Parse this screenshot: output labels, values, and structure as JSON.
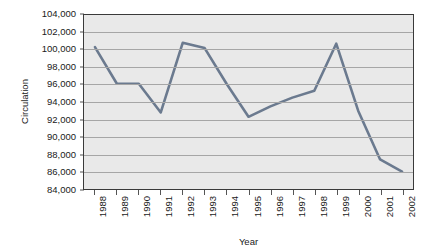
{
  "chart_data": {
    "type": "line",
    "title": "",
    "xlabel": "Year",
    "ylabel": "Circulation",
    "categories": [
      "1988",
      "1989",
      "1990",
      "1991",
      "1992",
      "1993",
      "1994",
      "1995",
      "1996",
      "1997",
      "1998",
      "1999",
      "2000",
      "2001",
      "2002"
    ],
    "values": [
      100300,
      96100,
      96100,
      92800,
      100800,
      100200,
      96100,
      92300,
      93500,
      94500,
      95300,
      100700,
      93000,
      87400,
      86000
    ],
    "ylim": [
      84000,
      104000
    ],
    "ytick_step": 2000,
    "ytick_labels": [
      "84,000",
      "86,000",
      "88,000",
      "90,000",
      "92,000",
      "94,000",
      "96,000",
      "98,000",
      "100,000",
      "102,000",
      "104,000"
    ],
    "grid": true,
    "legend": "none",
    "series_color": "#6b7a8f",
    "plot_background": "#e9e9e9",
    "gridline_color": "#a6a6a6",
    "border_color": "#3a3a3a"
  }
}
